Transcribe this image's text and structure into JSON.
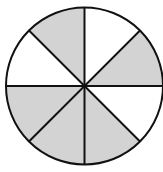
{
  "figure": {
    "sector_count": 8,
    "shaded_count": 5,
    "sectors": [
      {
        "index": 0,
        "start_deg": 0,
        "end_deg": 45,
        "shaded": false
      },
      {
        "index": 1,
        "start_deg": 45,
        "end_deg": 90,
        "shaded": true
      },
      {
        "index": 2,
        "start_deg": 90,
        "end_deg": 135,
        "shaded": false
      },
      {
        "index": 3,
        "start_deg": 135,
        "end_deg": 180,
        "shaded": true
      },
      {
        "index": 4,
        "start_deg": 180,
        "end_deg": 225,
        "shaded": true
      },
      {
        "index": 5,
        "start_deg": 225,
        "end_deg": 270,
        "shaded": true
      },
      {
        "index": 6,
        "start_deg": 270,
        "end_deg": 315,
        "shaded": false
      },
      {
        "index": 7,
        "start_deg": 315,
        "end_deg": 360,
        "shaded": true
      }
    ],
    "colors": {
      "shaded": "#d3d3d3",
      "unshaded": "#ffffff",
      "stroke": "#111111",
      "background": "#ffffff"
    },
    "geometry": {
      "cx": 84.5,
      "cy": 86,
      "r": 78.5,
      "stroke_width": 2
    }
  }
}
